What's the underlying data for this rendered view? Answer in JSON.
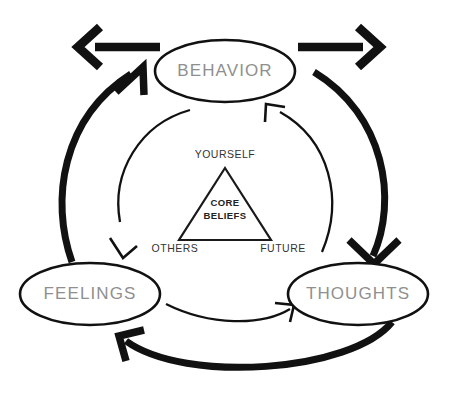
{
  "diagram": {
    "nodes": [
      {
        "id": "behavior",
        "label": "BEHAVIOR",
        "cx": 225,
        "cy": 71,
        "rx": 70,
        "ry": 31
      },
      {
        "id": "feelings",
        "label": "FEELINGS",
        "cx": 90,
        "cy": 294,
        "rx": 70,
        "ry": 31
      },
      {
        "id": "thoughts",
        "label": "THOUGHTS",
        "cx": 358,
        "cy": 294,
        "rx": 70,
        "ry": 31
      }
    ],
    "triangle": {
      "apex_label": "YOURSELF",
      "bottom_left_label": "OTHERS",
      "bottom_right_label": "FUTURE",
      "center_label_line1": "CORE",
      "center_label_line2": "BELIEFS"
    },
    "outer_arrows": [
      {
        "id": "feelings-to-behavior",
        "from": "FEELINGS",
        "to": "BEHAVIOR",
        "weight": "thick"
      },
      {
        "id": "behavior-to-thoughts",
        "from": "BEHAVIOR",
        "to": "THOUGHTS",
        "weight": "thick"
      },
      {
        "id": "thoughts-to-feelings",
        "from": "THOUGHTS",
        "to": "FEELINGS",
        "weight": "thick"
      }
    ],
    "inner_arrows": [
      {
        "id": "inner-behavior-to-feelings",
        "from": "BEHAVIOR",
        "to": "FEELINGS",
        "weight": "thin"
      },
      {
        "id": "inner-thoughts-to-behavior",
        "from": "THOUGHTS",
        "to": "BEHAVIOR",
        "weight": "thin"
      },
      {
        "id": "inner-feelings-to-thoughts",
        "from": "FEELINGS",
        "to": "THOUGHTS",
        "weight": "thin"
      }
    ],
    "straight_arrows": [
      {
        "id": "external-left-arrow",
        "direction": "left"
      },
      {
        "id": "external-right-arrow",
        "direction": "right"
      }
    ],
    "colors": {
      "node_text": "#8f8f8f",
      "line": "#111111",
      "triangle_text": "#333333",
      "core_text": "#222222",
      "background": "#ffffff"
    }
  }
}
